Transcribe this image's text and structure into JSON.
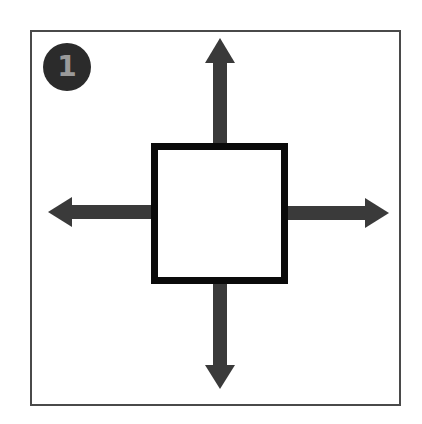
{
  "figure": {
    "badge_number": "1",
    "colors": {
      "arrow": "#3a3a3a",
      "square_border": "#0a0a0a",
      "frame_border": "#4a4a4a",
      "badge_fill": "#2b2b2b",
      "badge_text": "#9a9a9a"
    },
    "arrows": [
      {
        "direction": "up"
      },
      {
        "direction": "down"
      },
      {
        "direction": "left"
      },
      {
        "direction": "right"
      }
    ]
  }
}
